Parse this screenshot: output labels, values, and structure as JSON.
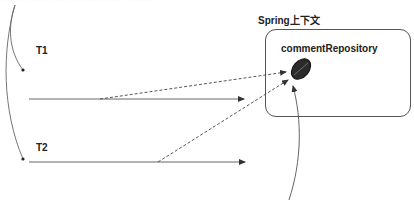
{
  "diagram": {
    "top_text": "··· ·············· ············ ·········",
    "context": {
      "title": "Spring上下文",
      "bean": "commentRepository"
    },
    "threads": [
      {
        "label": "T1"
      },
      {
        "label": "T2"
      }
    ],
    "colors": {
      "line": "#555555",
      "bean_fill": "#2b2b2b",
      "text": "#222222"
    }
  }
}
